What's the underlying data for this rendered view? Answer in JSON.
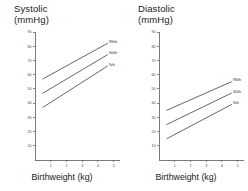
{
  "figure": {
    "panel_count": 2
  },
  "panels": [
    {
      "key": "systolic",
      "title": "Systolic\n(mmHg)",
      "title_line1": "Systolic",
      "title_line2": "(mmHg)",
      "xlabel": "Birthweight (kg)"
    },
    {
      "key": "diastolic",
      "title": "Diastolic\n(mmHg)",
      "title_line1": "Diastolic",
      "title_line2": "(mmHg)",
      "xlabel": "Birthweight (kg)"
    }
  ],
  "axes": {
    "y_ticks": [
      90,
      80,
      70,
      60,
      50,
      40,
      30,
      20,
      10
    ],
    "y_tick_labels": [
      "90",
      "80",
      "70",
      "60",
      "50",
      "40",
      "30",
      "20",
      "10"
    ],
    "x_ticks": [
      1,
      2,
      3,
      4,
      5
    ],
    "x_tick_labels": [
      "1",
      "2",
      "3",
      "4",
      "5"
    ],
    "ylim": [
      0,
      90
    ],
    "xlim": [
      0,
      5.4
    ],
    "grid": false
  },
  "colors": {
    "line": "#4a4a4a",
    "axis": "#6b6b6b",
    "text": "#1a1a1a",
    "background": "#ffffff"
  },
  "chart_data": [
    {
      "type": "line",
      "title": "Systolic (mmHg)",
      "xlabel": "Birthweight (kg)",
      "ylabel": "Systolic (mmHg)",
      "xlim": [
        0,
        5.4
      ],
      "ylim": [
        0,
        90
      ],
      "grid": false,
      "legend_position": "inline-right-end-of-line",
      "x": [
        0.5,
        4.6
      ],
      "series": [
        {
          "name": "95th",
          "values": [
            57,
            82
          ]
        },
        {
          "name": "50th",
          "values": [
            47,
            74
          ]
        },
        {
          "name": "5th",
          "values": [
            37,
            66
          ]
        }
      ]
    },
    {
      "type": "line",
      "title": "Diastolic (mmHg)",
      "xlabel": "Birthweight (kg)",
      "ylabel": "Diastolic (mmHg)",
      "xlim": [
        0,
        5.4
      ],
      "ylim": [
        0,
        90
      ],
      "grid": false,
      "legend_position": "inline-right-end-of-line",
      "x": [
        0.5,
        4.6
      ],
      "series": [
        {
          "name": "95th",
          "values": [
            35,
            55
          ]
        },
        {
          "name": "50th",
          "values": [
            25,
            47
          ]
        },
        {
          "name": "5th",
          "values": [
            15,
            39
          ]
        }
      ]
    }
  ]
}
